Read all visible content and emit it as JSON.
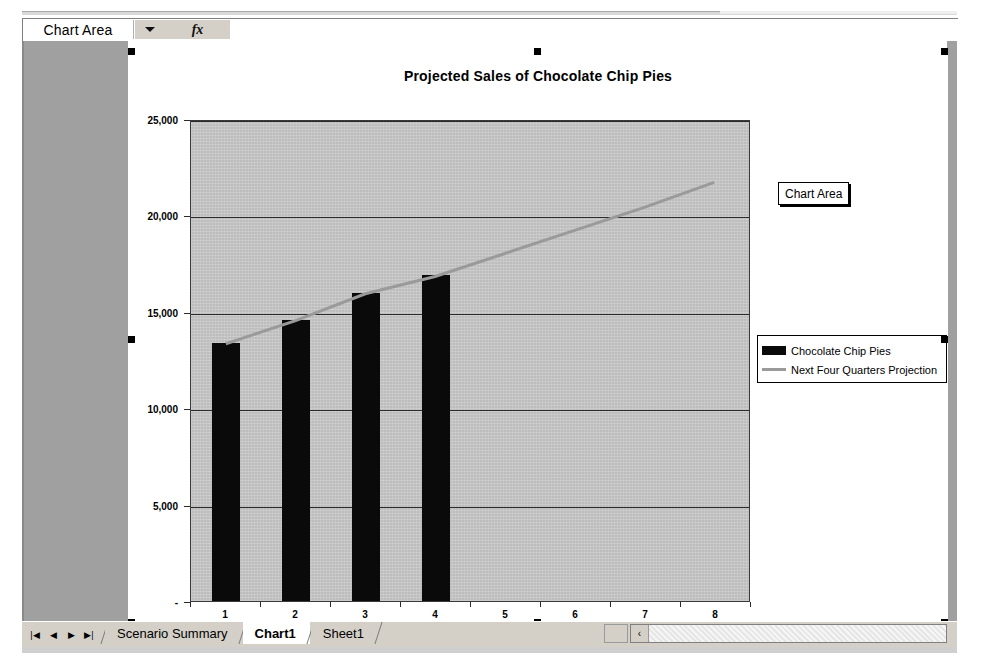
{
  "app": {
    "name_box_value": "Chart Area",
    "formula_bar_value": "",
    "fx_label": "fx",
    "dropdown_icon": "chevron-down-icon"
  },
  "tooltip": {
    "text": "Chart Area"
  },
  "chart_data": {
    "type": "bar",
    "title": "Projected Sales of Chocolate Chip Pies",
    "xlabel": "",
    "ylabel": "",
    "categories": [
      "1",
      "2",
      "3",
      "4",
      "5",
      "6",
      "7",
      "8"
    ],
    "ylim": [
      0,
      25000
    ],
    "ytick_values": [
      0,
      5000,
      10000,
      15000,
      20000,
      25000
    ],
    "ytick_labels": [
      "-",
      "5,000",
      "10,000",
      "15,000",
      "20,000",
      "25,000"
    ],
    "grid": true,
    "legend_position": "right",
    "plot_area_color": "#bdbdbd",
    "series": [
      {
        "name": "Chocolate Chip Pies",
        "type": "bar",
        "color": "#0a0a0a",
        "values": [
          13400,
          14600,
          16000,
          16900,
          null,
          null,
          null,
          null
        ]
      },
      {
        "name": "Next Four Quarters Projection",
        "type": "line",
        "color": "#9a9a9a",
        "values": [
          13400,
          14600,
          16000,
          16900,
          18100,
          19300,
          20500,
          21800
        ]
      }
    ]
  },
  "sheet_tabs": {
    "nav_buttons": [
      "first-sheet",
      "prev-sheet",
      "next-sheet",
      "last-sheet"
    ],
    "nav_glyphs": [
      "|◀",
      "◀",
      "▶",
      "▶|"
    ],
    "items": [
      {
        "label": "Scenario Summary",
        "active": false
      },
      {
        "label": "Chart1",
        "active": true
      },
      {
        "label": "Sheet1",
        "active": false
      }
    ]
  },
  "scrollbar": {
    "left_arrow_glyph": "‹"
  },
  "colors": {
    "bar": "#0a0a0a",
    "projection_line": "#9a9a9a",
    "plot_background": "#bdbdbd",
    "sheet_background": "#a0a0a0",
    "chart_background": "#ffffff"
  }
}
